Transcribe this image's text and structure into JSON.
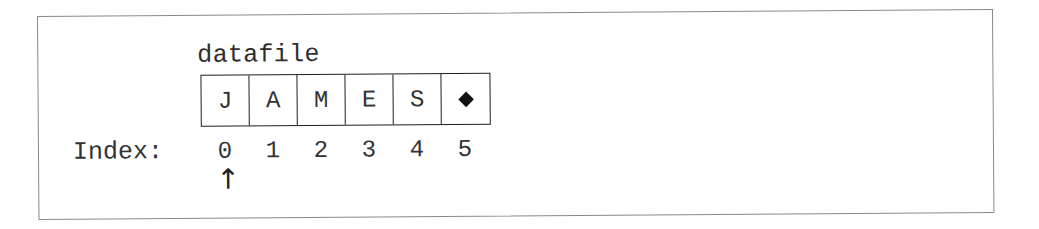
{
  "diagram": {
    "variable_name": "datafile",
    "cells": [
      {
        "value": "J",
        "type": "char"
      },
      {
        "value": "A",
        "type": "char"
      },
      {
        "value": "M",
        "type": "char"
      },
      {
        "value": "E",
        "type": "char"
      },
      {
        "value": "S",
        "type": "char"
      },
      {
        "value": "◆",
        "type": "end-marker"
      }
    ],
    "index_label": "Index:",
    "indices": [
      "0",
      "1",
      "2",
      "3",
      "4",
      "5"
    ],
    "pointer": {
      "glyph": "↑",
      "position_index": 0
    },
    "colors": {
      "frame_border": "#8a8a8a",
      "cell_border": "#1e1e1e",
      "text": "#333333",
      "background": "#ffffff"
    }
  }
}
